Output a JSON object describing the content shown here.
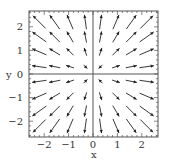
{
  "chart_data": {
    "type": "vector_field",
    "title": "",
    "xlabel": "x",
    "ylabel": "y",
    "xlim": [
      -2.65,
      2.65
    ],
    "ylim": [
      -2.65,
      2.65
    ],
    "x_ticks": [
      -2,
      -1,
      0,
      1,
      2
    ],
    "y_ticks": [
      -2,
      -1,
      0,
      1,
      2
    ],
    "x_tick_labels": [
      "−2",
      "−1",
      "0",
      "1",
      "2"
    ],
    "y_tick_labels": [
      "−2",
      "−1",
      "0",
      "1",
      "2"
    ],
    "grid": false,
    "zero_lines": true,
    "sample_points": [
      -2.2,
      -1.57,
      -0.94,
      -0.31,
      0.31,
      0.94,
      1.57,
      2.2
    ],
    "field_description": "Radial field: vectors point away from origin for larger radius, toward origin nearest the origin; length grows with distance",
    "inner_sign_flip_radius": 0.5,
    "arrow_color": "#222222",
    "frame_color": "#555555"
  },
  "layout": {
    "frame": {
      "left": 29,
      "top": 11,
      "right": 158,
      "bottom": 137
    },
    "origin_px": {
      "x": 93,
      "y": 74
    },
    "unit_px": {
      "x": 24.4,
      "y": 23.6
    }
  }
}
